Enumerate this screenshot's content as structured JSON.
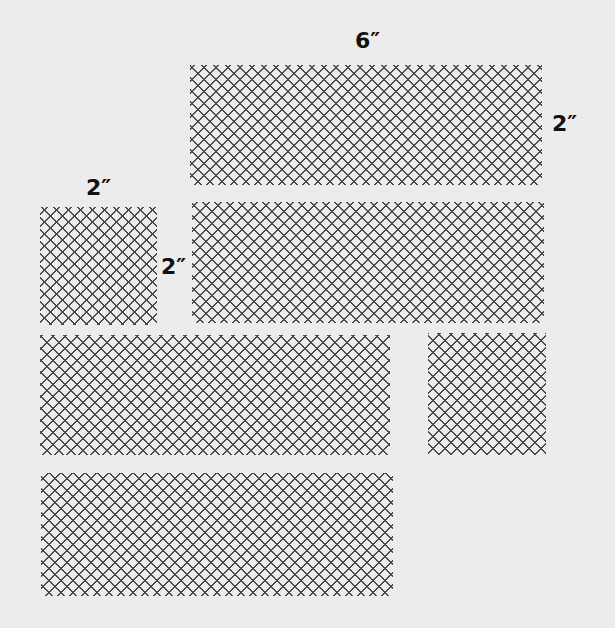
{
  "diagram": {
    "background": "#ececec",
    "line_color": "#4a4a4a",
    "label_color": "#111111",
    "rectangles": [
      {
        "id": "rect-top-6x2",
        "x": 190,
        "y": 65,
        "w": 352,
        "h": 120
      },
      {
        "id": "rect-small-square-2x2",
        "x": 40,
        "y": 207,
        "w": 117,
        "h": 118
      },
      {
        "id": "rect-middle-right",
        "x": 192,
        "y": 202,
        "w": 352,
        "h": 121
      },
      {
        "id": "rect-row3-left",
        "x": 40,
        "y": 335,
        "w": 350,
        "h": 120
      },
      {
        "id": "rect-row3-right-small",
        "x": 428,
        "y": 333,
        "w": 118,
        "h": 122
      },
      {
        "id": "rect-bottom",
        "x": 41,
        "y": 473,
        "w": 352,
        "h": 123
      }
    ],
    "labels": [
      {
        "id": "label-top-width",
        "text": "6″",
        "x": 355,
        "y": 30
      },
      {
        "id": "label-top-height",
        "text": "2″",
        "x": 552,
        "y": 113
      },
      {
        "id": "label-square-width",
        "text": "2″",
        "x": 86,
        "y": 177
      },
      {
        "id": "label-square-height",
        "text": "2″",
        "x": 161,
        "y": 256
      }
    ]
  }
}
